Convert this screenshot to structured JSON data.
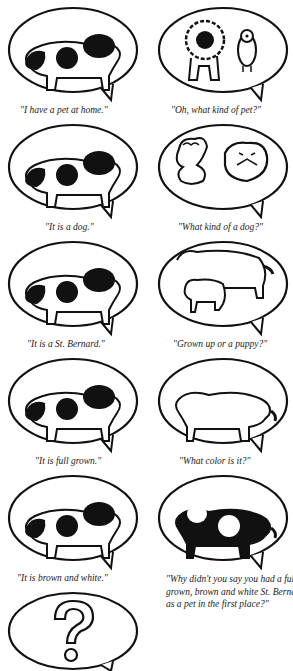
{
  "strip": {
    "panels": [
      {
        "side": "left",
        "row": 0,
        "picture": "st-bernard-spotted",
        "caption": "\"I have a pet at home.\""
      },
      {
        "side": "right",
        "row": 0,
        "picture": "lion-and-owl",
        "caption": "\"Oh, what kind of  pet?\""
      },
      {
        "side": "left",
        "row": 1,
        "picture": "st-bernard-spotted",
        "caption": "\"It is a dog.\""
      },
      {
        "side": "right",
        "row": 1,
        "picture": "poodle-and-bulldog",
        "caption": "\"What kind of a dog?\""
      },
      {
        "side": "left",
        "row": 2,
        "picture": "st-bernard-spotted",
        "caption": "\"It is a St. Bernard.\""
      },
      {
        "side": "right",
        "row": 2,
        "picture": "adult-and-puppy-outline",
        "caption": "\"Grown up or a  puppy?\""
      },
      {
        "side": "left",
        "row": 3,
        "picture": "st-bernard-spotted",
        "caption": "\"It is full grown.\""
      },
      {
        "side": "right",
        "row": 3,
        "picture": "st-bernard-outline",
        "caption": "\"What color is it?\""
      },
      {
        "side": "left",
        "row": 4,
        "picture": "st-bernard-spotted",
        "caption": "\"It is brown and white.\""
      },
      {
        "side": "right",
        "row": 4,
        "picture": "st-bernard-inverted",
        "caption": "\"Why didn't you say you had a full-grown, brown and white St. Bernard as a pet in the first place?\""
      },
      {
        "side": "left",
        "row": 5,
        "picture": "question-mark",
        "caption": ""
      }
    ]
  },
  "colors": {
    "ink": "#111111",
    "paper": "#ffffff"
  }
}
